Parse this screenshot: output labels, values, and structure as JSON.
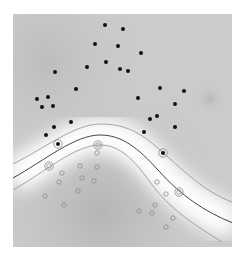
{
  "diagram": {
    "type": "svm-decision-boundary",
    "plot_area": {
      "x": 13,
      "y": 14,
      "width": 219,
      "height": 233
    },
    "colors": {
      "positive_point": "#111111",
      "negative_point_stroke": "#8a8a8a",
      "boundary": "#444444",
      "margin": "#9a9a9a",
      "background_dark": "#bdbdbd",
      "background_light": "#ffffff"
    },
    "positive_points": [
      [
        105,
        25
      ],
      [
        123,
        29
      ],
      [
        95,
        44
      ],
      [
        118,
        46
      ],
      [
        141,
        53
      ],
      [
        106,
        62
      ],
      [
        87,
        67
      ],
      [
        120,
        69
      ],
      [
        128,
        71
      ],
      [
        55,
        72
      ],
      [
        76,
        89
      ],
      [
        160,
        88
      ],
      [
        184,
        91
      ],
      [
        138,
        98
      ],
      [
        37,
        99
      ],
      [
        48,
        97
      ],
      [
        42,
        107
      ],
      [
        53,
        106
      ],
      [
        175,
        104
      ],
      [
        157,
        116
      ],
      [
        150,
        119
      ],
      [
        71,
        122
      ],
      [
        54,
        127
      ],
      [
        175,
        127
      ],
      [
        144,
        132
      ],
      [
        46,
        135
      ]
    ],
    "positive_support_vectors": [
      [
        58,
        144
      ],
      [
        163,
        153
      ]
    ],
    "negative_points": [
      [
        97,
        153
      ],
      [
        80,
        166
      ],
      [
        97,
        167
      ],
      [
        62,
        173
      ],
      [
        82,
        178
      ],
      [
        59,
        182
      ],
      [
        94,
        181
      ],
      [
        157,
        182
      ],
      [
        78,
        191
      ],
      [
        166,
        194
      ],
      [
        45,
        196
      ],
      [
        155,
        205
      ],
      [
        64,
        205
      ],
      [
        139,
        211
      ],
      [
        152,
        213
      ],
      [
        173,
        218
      ],
      [
        166,
        227
      ]
    ],
    "negative_support_vectors": [
      [
        98,
        145
      ],
      [
        49,
        166
      ],
      [
        179,
        192
      ]
    ],
    "curves": {
      "upper_margin": "M13,164 C45,148 75,124 100,124 C125,124 140,132 160,150 C185,172 205,192 232,202",
      "decision_boundary": "M13,178 C45,160 75,135 100,135 C122,135 138,148 158,170 C180,195 205,212 233,223",
      "lower_margin": "M13,190 C45,172 75,145 100,145 C120,145 134,160 150,182 C170,210 195,225 222,242"
    }
  }
}
